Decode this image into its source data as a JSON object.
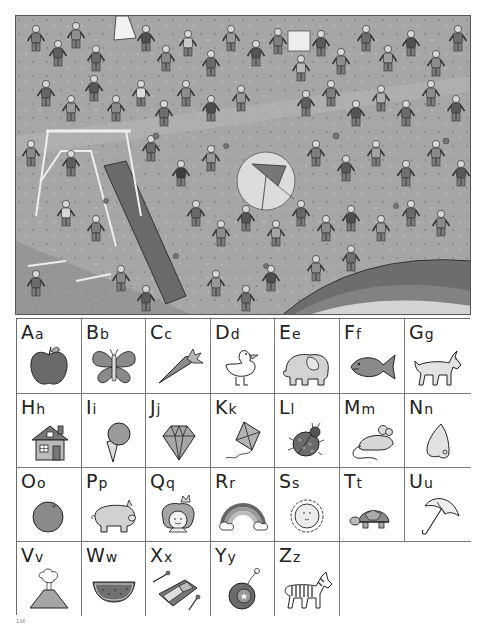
{
  "scene": {
    "description": "Crowded playground search-and-find illustration",
    "highlight": {
      "label": "kite",
      "cx": 250,
      "cy": 165,
      "r": 29
    }
  },
  "alphabet": [
    {
      "upper": "A",
      "lower": "a",
      "picture": "apple"
    },
    {
      "upper": "B",
      "lower": "b",
      "picture": "butterfly"
    },
    {
      "upper": "C",
      "lower": "c",
      "picture": "carrot"
    },
    {
      "upper": "D",
      "lower": "d",
      "picture": "duck"
    },
    {
      "upper": "E",
      "lower": "e",
      "picture": "elephant"
    },
    {
      "upper": "F",
      "lower": "f",
      "picture": "fish"
    },
    {
      "upper": "G",
      "lower": "g",
      "picture": "goat"
    },
    {
      "upper": "H",
      "lower": "h",
      "picture": "house"
    },
    {
      "upper": "I",
      "lower": "i",
      "picture": "ice-cream"
    },
    {
      "upper": "J",
      "lower": "j",
      "picture": "jewel"
    },
    {
      "upper": "K",
      "lower": "k",
      "picture": "kite"
    },
    {
      "upper": "L",
      "lower": "l",
      "picture": "ladybug"
    },
    {
      "upper": "M",
      "lower": "m",
      "picture": "mouse"
    },
    {
      "upper": "N",
      "lower": "n",
      "picture": "nose"
    },
    {
      "upper": "O",
      "lower": "o",
      "picture": "orange"
    },
    {
      "upper": "P",
      "lower": "p",
      "picture": "pig"
    },
    {
      "upper": "Q",
      "lower": "q",
      "picture": "queen"
    },
    {
      "upper": "R",
      "lower": "r",
      "picture": "rainbow"
    },
    {
      "upper": "S",
      "lower": "s",
      "picture": "sun"
    },
    {
      "upper": "T",
      "lower": "t",
      "picture": "turtle"
    },
    {
      "upper": "U",
      "lower": "u",
      "picture": "umbrella"
    },
    {
      "upper": "V",
      "lower": "v",
      "picture": "volcano"
    },
    {
      "upper": "W",
      "lower": "w",
      "picture": "watermelon"
    },
    {
      "upper": "X",
      "lower": "x",
      "picture": "xylophone"
    },
    {
      "upper": "Y",
      "lower": "y",
      "picture": "yo-yo"
    },
    {
      "upper": "Z",
      "lower": "z",
      "picture": "zebra"
    }
  ],
  "page_number": "116",
  "colors": {
    "ink": "#222222",
    "fill_dark": "#6e6e6e",
    "fill_mid": "#9a9a9a",
    "fill_light": "#cfcfcf",
    "scene_bg": "#a9a9a9"
  }
}
